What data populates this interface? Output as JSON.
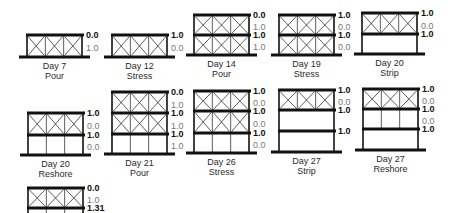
{
  "figure": {
    "stages": [
      {
        "day": "Day 7",
        "op": "Pour",
        "x": 27,
        "ground": 57,
        "slabs": [
          35
        ],
        "bays": [
          "shore"
        ],
        "values": [
          {
            "t": "0.0",
            "b": true
          },
          {
            "t": "1.0",
            "b": false
          }
        ]
      },
      {
        "day": "Day 12",
        "op": "Stress",
        "x": 112,
        "ground": 57,
        "slabs": [
          35
        ],
        "bays": [
          "shore"
        ],
        "values": [
          {
            "t": "1.0",
            "b": true
          },
          {
            "t": "0.0",
            "b": false
          }
        ]
      },
      {
        "day": "Day 14",
        "op": "Pour",
        "x": 194,
        "ground": 55,
        "slabs": [
          15,
          35
        ],
        "bays": [
          "shore",
          "shore"
        ],
        "values": [
          {
            "t": "0.0",
            "b": true
          },
          {
            "t": "1.0",
            "b": false
          },
          {
            "t": "1.0",
            "b": true
          },
          {
            "t": "1.0",
            "b": false
          }
        ]
      },
      {
        "day": "Day 19",
        "op": "Stress",
        "x": 279,
        "ground": 55,
        "slabs": [
          15,
          35
        ],
        "bays": [
          "shore",
          "shore"
        ],
        "values": [
          {
            "t": "1.0",
            "b": true
          },
          {
            "t": "0.0",
            "b": false
          },
          {
            "t": "1.0",
            "b": true
          },
          {
            "t": "0.0",
            "b": false
          }
        ]
      },
      {
        "day": "Day 20",
        "op": "Strip",
        "x": 362,
        "ground": 54,
        "slabs": [
          13,
          34
        ],
        "bays": [
          "shore",
          "empty"
        ],
        "values": [
          {
            "t": "1.0",
            "b": true
          },
          {
            "t": "0.0",
            "b": false
          },
          {
            "t": "1.0",
            "b": true
          }
        ]
      },
      {
        "day": "Day 20",
        "op": "Reshore",
        "x": 28,
        "ground": 155,
        "slabs": [
          113,
          135
        ],
        "bays": [
          "shore",
          "reshore"
        ],
        "values": [
          {
            "t": "1.0",
            "b": true
          },
          {
            "t": "0.0",
            "b": false
          },
          {
            "t": "1.0",
            "b": true
          },
          {
            "t": "0.0",
            "b": false
          }
        ]
      },
      {
        "day": "Day 21",
        "op": "Pour",
        "x": 112,
        "ground": 154,
        "slabs": [
          92,
          113,
          134
        ],
        "bays": [
          "shore",
          "shore",
          "reshore"
        ],
        "values": [
          {
            "t": "0.0",
            "b": true
          },
          {
            "t": "1.0",
            "b": false
          },
          {
            "t": "1.0",
            "b": true
          },
          {
            "t": "1.0",
            "b": false
          },
          {
            "t": "1.0",
            "b": true
          },
          {
            "t": "1.0",
            "b": false
          }
        ]
      },
      {
        "day": "Day 26",
        "op": "Stress",
        "x": 194,
        "ground": 153,
        "slabs": [
          91,
          111,
          133
        ],
        "bays": [
          "shore",
          "shore",
          "reshore"
        ],
        "values": [
          {
            "t": "1.0",
            "b": true
          },
          {
            "t": "0.0",
            "b": false
          },
          {
            "t": "1.0",
            "b": true
          },
          {
            "t": "0.0",
            "b": false
          },
          {
            "t": "1.0",
            "b": true
          },
          {
            "t": "0.0",
            "b": false
          }
        ]
      },
      {
        "day": "Day 27",
        "op": "Strip",
        "x": 279,
        "ground": 152,
        "slabs": [
          90,
          110,
          131
        ],
        "bays": [
          "shore",
          "empty",
          "empty"
        ],
        "values": [
          {
            "t": "1.0",
            "b": true
          },
          {
            "t": "0.0",
            "b": false
          },
          {
            "t": "1.0",
            "b": true
          },
          null,
          {
            "t": "1.0",
            "b": true
          }
        ]
      },
      {
        "day": "Day 27",
        "op": "Reshore",
        "x": 363,
        "ground": 150,
        "slabs": [
          89,
          109,
          129
        ],
        "bays": [
          "shore",
          "reshore",
          "empty"
        ],
        "values": [
          {
            "t": "1.0",
            "b": true
          },
          {
            "t": "0.0",
            "b": false
          },
          {
            "t": "1.0",
            "b": true
          },
          {
            "t": "0.0",
            "b": false
          },
          {
            "t": "1.0",
            "b": true
          }
        ]
      },
      {
        "day": "",
        "op": "",
        "x": 28,
        "ground": 230,
        "slabs": [
          188,
          208
        ],
        "bays": [
          "shore",
          "reshore"
        ],
        "values": [
          {
            "t": "0.0",
            "b": true
          },
          {
            "t": "1.0",
            "b": false
          },
          {
            "t": "1.31",
            "b": true
          }
        ]
      }
    ]
  },
  "colors": {
    "line": "#111111",
    "thin": "#333333",
    "bold_text": "#111111",
    "light_text": "#777777"
  }
}
